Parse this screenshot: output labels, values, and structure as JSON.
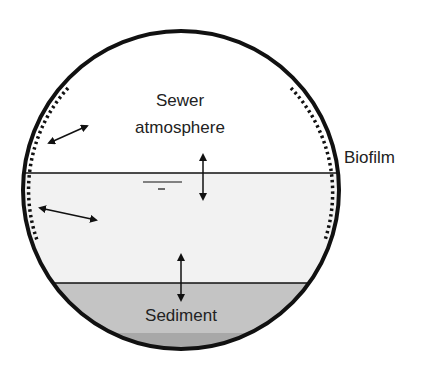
{
  "diagram": {
    "labels": {
      "atmosphere_line1": "Sewer",
      "atmosphere_line2": "atmosphere",
      "biofilm": "Biofilm",
      "sediment": "Sediment"
    },
    "zones": [
      {
        "name": "sewer-atmosphere",
        "color": "#ffffff"
      },
      {
        "name": "wastewater",
        "color": "#f2f2f2"
      },
      {
        "name": "sediment",
        "color": "#c4c4c4"
      },
      {
        "name": "deep-sediment",
        "color": "#a9a9a9"
      }
    ],
    "colors": {
      "outline": "#111111",
      "text": "#222222"
    },
    "arrows": [
      {
        "name": "biofilm-atmosphere-exchange",
        "type": "double"
      },
      {
        "name": "atmosphere-water-exchange",
        "type": "double"
      },
      {
        "name": "biofilm-water-exchange",
        "type": "double"
      },
      {
        "name": "water-sediment-exchange",
        "type": "double"
      }
    ],
    "symbols": [
      "water-level-symbol"
    ]
  }
}
